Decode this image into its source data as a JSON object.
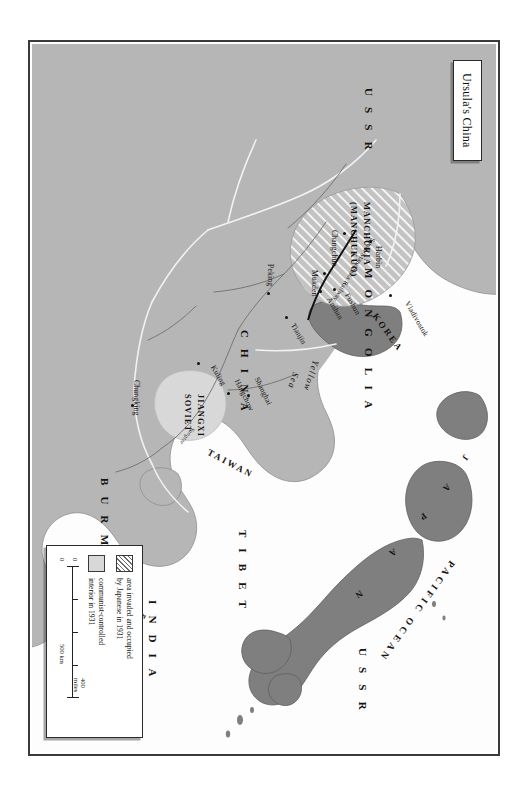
{
  "title": {
    "text": "Ursula's China"
  },
  "map": {
    "countries": [
      {
        "name": "USSR",
        "label": "U S S R"
      },
      {
        "name": "USSR-south",
        "label": "U S S R"
      },
      {
        "name": "MONGOLIA",
        "label": "M O N G O L I A"
      },
      {
        "name": "CHINA",
        "label": "C H I N A"
      },
      {
        "name": "TIBET",
        "label": "T I B E T"
      },
      {
        "name": "INDIA",
        "label": "I N D I A"
      },
      {
        "name": "BURMA",
        "label": "B U R M A"
      },
      {
        "name": "KOREA",
        "label": "KOREA"
      },
      {
        "name": "JAPAN",
        "label": "JAPAN"
      },
      {
        "name": "TAIWAN",
        "label": "TAIWAN"
      },
      {
        "name": "HAINAN",
        "label": "Hainan"
      },
      {
        "name": "FRENCH-INDOCHINA-1",
        "label": "FRENCH"
      },
      {
        "name": "FRENCH-INDOCHINA-2",
        "label": "INDOCHINA"
      }
    ],
    "regions": [
      {
        "name": "manchuria",
        "line1": "MANCHURIA",
        "line2": "(MANCHUKUO)"
      },
      {
        "name": "jiangxi",
        "line1": "JIANGXI",
        "line2": "SOVIET"
      }
    ],
    "waters": [
      {
        "name": "pacific-ocean",
        "label": "PACIFIC OCEAN"
      },
      {
        "name": "yellow-sea-1",
        "label": "Yellow"
      },
      {
        "name": "yellow-sea-2",
        "label": "Sea"
      }
    ],
    "cities": [
      {
        "name": "vladivostok",
        "label": "Vladivostok"
      },
      {
        "name": "harbin",
        "label": "Harbin"
      },
      {
        "name": "changchun",
        "label": "Changchun"
      },
      {
        "name": "mukden",
        "label": "Mukden"
      },
      {
        "name": "fushun",
        "label": "Fushun"
      },
      {
        "name": "anshan",
        "label": "Anshan"
      },
      {
        "name": "peking",
        "label": "Peking"
      },
      {
        "name": "tianjin",
        "label": "Tianjin"
      },
      {
        "name": "shanghai",
        "label": "Shanghai"
      },
      {
        "name": "hangchow",
        "label": "Hangchow"
      },
      {
        "name": "kuling",
        "label": "Kuling"
      },
      {
        "name": "chungking",
        "label": "Chungking"
      }
    ],
    "railway": {
      "label": "South Manchuria Railway"
    },
    "rivers": [
      {
        "name": "yangtze",
        "label": "Yangtze"
      }
    ]
  },
  "legend": {
    "items": [
      {
        "swatch": "hatched",
        "line1": "area invaded and occupied",
        "line2": "by Japanese in 1931"
      },
      {
        "swatch": "light-gray",
        "line1": "communist-controlled",
        "line2": "interior in 1931"
      }
    ],
    "scale": {
      "zero_top": "0",
      "zero_bottom": "0",
      "miles": "400 miles",
      "km": "500 km"
    }
  },
  "colors": {
    "land": "#b6b6b6",
    "land_dark": "#7f7f7f",
    "land_light": "#d8d8d8",
    "water": "#fdfdfd",
    "ink": "#15110e",
    "frame": "#3a3a3a"
  }
}
